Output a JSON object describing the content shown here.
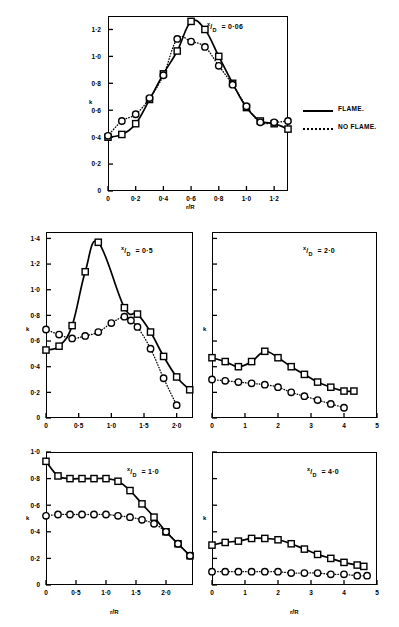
{
  "figure": {
    "legend": {
      "flame_label": "FLAME.",
      "no_flame_label": "NO FLAME.",
      "flame_style": "solid-line",
      "no_flame_style": "dotted-line"
    },
    "axis_label_x": "r/R",
    "axis_label_y": "k"
  },
  "chart_data": [
    {
      "type": "line",
      "panel": "top",
      "title": "x/D = 0·06",
      "annotation": "x/D = 0·06",
      "xlabel": "r/R",
      "ylabel": "k",
      "xlim": [
        0,
        1.3
      ],
      "ylim": [
        0,
        1.3
      ],
      "xticks": [
        0,
        0.2,
        0.4,
        0.6,
        0.8,
        1.0,
        1.2
      ],
      "xticklabels": [
        "0",
        "0·2",
        "0·4",
        "0·6",
        "0·8",
        "1·0",
        "1·2"
      ],
      "yticks": [
        0,
        0.2,
        0.4,
        0.6,
        0.8,
        1.0,
        1.2
      ],
      "yticklabels": [
        "0",
        "0·2",
        "0·4",
        "0·6",
        "0·8",
        "1·0",
        "1·2"
      ],
      "grid": false,
      "legend_position": "outside-right",
      "series": [
        {
          "name": "FLAME.",
          "marker": "square",
          "style": "solid",
          "x": [
            0.0,
            0.1,
            0.2,
            0.3,
            0.4,
            0.5,
            0.6,
            0.7,
            0.8,
            0.9,
            1.0,
            1.1,
            1.2,
            1.3
          ],
          "values": [
            0.4,
            0.42,
            0.5,
            0.68,
            0.87,
            1.04,
            1.26,
            1.2,
            1.0,
            0.8,
            0.62,
            0.52,
            0.5,
            0.46
          ]
        },
        {
          "name": "NO FLAME.",
          "marker": "circle",
          "style": "dotted",
          "x": [
            0.0,
            0.1,
            0.2,
            0.3,
            0.4,
            0.5,
            0.6,
            0.7,
            0.8,
            0.9,
            1.0,
            1.1,
            1.2,
            1.3
          ],
          "values": [
            0.41,
            0.52,
            0.57,
            0.69,
            0.86,
            1.13,
            1.11,
            1.07,
            0.93,
            0.79,
            0.63,
            0.51,
            0.51,
            0.52
          ]
        }
      ]
    },
    {
      "type": "line",
      "panel": "mid-left",
      "title": "x/D = 0·5",
      "annotation": "x/D = 0·5",
      "xlabel": "",
      "ylabel": "k",
      "xlim": [
        0,
        2.25
      ],
      "ylim": [
        0,
        1.45
      ],
      "xticks": [
        0,
        0.5,
        1.0,
        1.5,
        2.0
      ],
      "xticklabels": [
        "0",
        "0·5",
        "1·0",
        "1·5",
        "2·0"
      ],
      "yticks": [
        0,
        0.2,
        0.4,
        0.6,
        0.8,
        1.0,
        1.2,
        1.4
      ],
      "yticklabels": [
        "0",
        "0·2",
        "0·4",
        "0·6",
        "0·8",
        "1·0",
        "1·2",
        "1·4"
      ],
      "grid": false,
      "series": [
        {
          "name": "FLAME.",
          "marker": "square",
          "style": "solid",
          "x": [
            0.0,
            0.2,
            0.4,
            0.6,
            0.8,
            1.2,
            1.4,
            1.6,
            1.8,
            2.0,
            2.2
          ],
          "values": [
            0.53,
            0.56,
            0.72,
            1.14,
            1.37,
            0.86,
            0.81,
            0.67,
            0.48,
            0.32,
            0.22
          ]
        },
        {
          "name": "NO FLAME.",
          "marker": "circle",
          "style": "dotted",
          "x": [
            0.0,
            0.2,
            0.4,
            0.6,
            0.8,
            1.0,
            1.2,
            1.3,
            1.4,
            1.6,
            1.8,
            2.0
          ],
          "values": [
            0.69,
            0.65,
            0.62,
            0.64,
            0.67,
            0.74,
            0.79,
            0.76,
            0.71,
            0.54,
            0.31,
            0.1
          ]
        }
      ]
    },
    {
      "type": "line",
      "panel": "mid-right",
      "title": "x/D = 2·0",
      "annotation": "x/D = 2·0",
      "xlabel": "",
      "ylabel": "k",
      "xlim": [
        0,
        5
      ],
      "ylim": [
        0,
        1.45
      ],
      "xticks": [
        0,
        1,
        2,
        3,
        4,
        5
      ],
      "xticklabels": [
        "0",
        "1",
        "2",
        "3",
        "4",
        "5"
      ],
      "yticks": [
        0,
        0.2,
        0.4,
        0.6,
        0.8,
        1.0,
        1.2,
        1.4
      ],
      "yticklabels": [
        "",
        "",
        "",
        "",
        "",
        "",
        "",
        ""
      ],
      "grid": false,
      "series": [
        {
          "name": "FLAME.",
          "marker": "square",
          "style": "solid",
          "x": [
            0.0,
            0.4,
            0.8,
            1.2,
            1.6,
            2.0,
            2.4,
            2.8,
            3.2,
            3.6,
            4.0,
            4.3
          ],
          "values": [
            0.47,
            0.44,
            0.4,
            0.44,
            0.52,
            0.47,
            0.4,
            0.34,
            0.28,
            0.24,
            0.21,
            0.21
          ]
        },
        {
          "name": "NO FLAME.",
          "marker": "circle",
          "style": "dotted",
          "x": [
            0.0,
            0.4,
            0.8,
            1.2,
            1.6,
            2.0,
            2.4,
            2.8,
            3.2,
            3.6,
            4.0
          ],
          "values": [
            0.3,
            0.29,
            0.28,
            0.27,
            0.26,
            0.24,
            0.2,
            0.17,
            0.14,
            0.11,
            0.08
          ]
        }
      ]
    },
    {
      "type": "line",
      "panel": "bottom-left",
      "title": "x/D = 1·0",
      "annotation": "x/D = 1·0",
      "xlabel": "r/R",
      "ylabel": "k",
      "xlim": [
        0,
        2.45
      ],
      "ylim": [
        0,
        1.0
      ],
      "xticks": [
        0,
        0.5,
        1.0,
        1.5,
        2.0
      ],
      "xticklabels": [
        "0",
        "0·5",
        "1·0",
        "1·5",
        "2·0"
      ],
      "yticks": [
        0,
        0.2,
        0.4,
        0.6,
        0.8,
        1.0
      ],
      "yticklabels": [
        "0",
        "0·2",
        "0·4",
        "0·6",
        "0·8",
        "1·0"
      ],
      "grid": false,
      "series": [
        {
          "name": "FLAME.",
          "marker": "square",
          "style": "solid",
          "x": [
            0.0,
            0.2,
            0.4,
            0.6,
            0.8,
            1.0,
            1.2,
            1.4,
            1.6,
            1.8,
            2.0,
            2.2,
            2.4
          ],
          "values": [
            0.93,
            0.82,
            0.8,
            0.8,
            0.8,
            0.8,
            0.78,
            0.71,
            0.61,
            0.51,
            0.4,
            0.31,
            0.22
          ]
        },
        {
          "name": "NO FLAME.",
          "marker": "circle",
          "style": "dotted",
          "x": [
            0.0,
            0.2,
            0.4,
            0.6,
            0.8,
            1.0,
            1.2,
            1.4,
            1.6,
            1.8,
            2.0,
            2.2,
            2.4
          ],
          "values": [
            0.52,
            0.53,
            0.53,
            0.53,
            0.53,
            0.53,
            0.52,
            0.51,
            0.49,
            0.46,
            0.4,
            0.31,
            0.22
          ]
        }
      ]
    },
    {
      "type": "line",
      "panel": "bottom-right",
      "title": "x/D = 4·0",
      "annotation": "x/D = 4·0",
      "xlabel": "r/R",
      "ylabel": "k",
      "xlim": [
        0,
        5
      ],
      "ylim": [
        0,
        1.0
      ],
      "xticks": [
        0,
        1,
        2,
        3,
        4,
        5
      ],
      "xticklabels": [
        "0",
        "1",
        "2",
        "3",
        "4",
        "5"
      ],
      "yticks": [
        0,
        0.2,
        0.4,
        0.6,
        0.8,
        1.0
      ],
      "yticklabels": [
        "",
        "",
        "",
        "",
        "",
        ""
      ],
      "grid": false,
      "series": [
        {
          "name": "FLAME.",
          "marker": "square",
          "style": "solid",
          "x": [
            0.0,
            0.4,
            0.8,
            1.2,
            1.6,
            2.0,
            2.4,
            2.8,
            3.2,
            3.6,
            4.0,
            4.4,
            4.6
          ],
          "values": [
            0.3,
            0.32,
            0.33,
            0.35,
            0.35,
            0.34,
            0.31,
            0.27,
            0.23,
            0.2,
            0.17,
            0.15,
            0.14
          ]
        },
        {
          "name": "NO FLAME.",
          "marker": "circle",
          "style": "dotted",
          "x": [
            0.0,
            0.4,
            0.8,
            1.2,
            1.6,
            2.0,
            2.4,
            2.8,
            3.2,
            3.6,
            4.0,
            4.4,
            4.7
          ],
          "values": [
            0.1,
            0.1,
            0.1,
            0.1,
            0.1,
            0.1,
            0.09,
            0.09,
            0.09,
            0.08,
            0.08,
            0.07,
            0.07
          ]
        }
      ]
    }
  ]
}
